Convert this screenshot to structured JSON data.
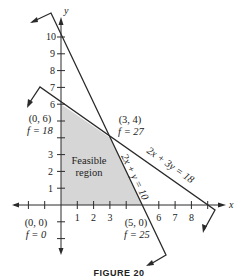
{
  "figure": {
    "caption": "FIGURE 20",
    "region_label_line1": "Feasible",
    "region_label_line2": "region",
    "axis_x_label": "x",
    "axis_y_label": "y",
    "x_ticks": [
      "1",
      "2",
      "3",
      "",
      "5",
      "6",
      "7",
      "8"
    ],
    "y_ticks": [
      "1",
      "2",
      "3",
      "",
      "",
      "6",
      "7",
      "8",
      "9",
      "10"
    ],
    "constraints": [
      {
        "label": "2x + 3y = 18"
      },
      {
        "label": "2x + y = 10"
      }
    ],
    "vertices": [
      {
        "point": "(0, 6)",
        "f": "f = 18"
      },
      {
        "point": "(3, 4)",
        "f": "f = 27"
      },
      {
        "point": "(0, 0)",
        "f": "f = 0"
      },
      {
        "point": "(5, 0)",
        "f": "f = 25"
      }
    ],
    "colors": {
      "region_fill": "#d6d6d6",
      "lines": "#2a2a2a"
    }
  }
}
